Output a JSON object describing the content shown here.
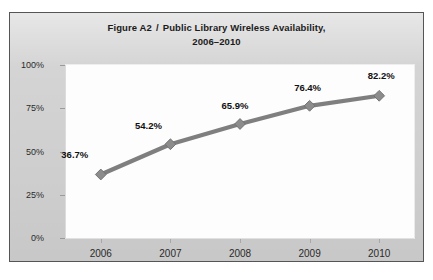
{
  "figure": {
    "label": "Figure A2",
    "separator": "/",
    "title_line1": "Public Library Wireless Availability,",
    "title_line2": "2006–2010"
  },
  "colors": {
    "series_line": "#7f7f7f",
    "marker": "#8c8c8c",
    "marker_edge": "#6e6e6e",
    "plot_background": "#fdfdfd",
    "figure_background": "#d4d4d4",
    "frame_border": "#555555",
    "axis": "#a8a8a8",
    "label_text": "#111111"
  },
  "chart_data": {
    "type": "line",
    "xlabel": "",
    "ylabel": "",
    "categories": [
      "2006",
      "2007",
      "2008",
      "2009",
      "2010"
    ],
    "values": [
      36.7,
      54.2,
      65.9,
      76.4,
      82.2
    ],
    "point_labels": [
      "36.7%",
      "54.2%",
      "65.9%",
      "76.4%",
      "82.2%"
    ],
    "ylim": [
      0,
      100
    ],
    "ytick_values": [
      0,
      25,
      50,
      75,
      100
    ],
    "ytick_labels": [
      "0%",
      "25%",
      "50%",
      "75%",
      "100%"
    ],
    "xtick_labels": [
      "2006",
      "2007",
      "2008",
      "2009",
      "2010"
    ],
    "grid": false,
    "legend": false,
    "legend_position": "none",
    "series": [
      {
        "name": "Public library wireless availability",
        "values": [
          36.7,
          54.2,
          65.9,
          76.4,
          82.2
        ],
        "marker": "diamond"
      }
    ]
  }
}
